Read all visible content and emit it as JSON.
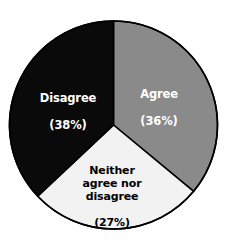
{
  "chart_data": {
    "type": "pie",
    "title": "",
    "subtitle": "",
    "xlabel": "",
    "ylabel": "",
    "legend_position": "none",
    "labels_inside_slices": true,
    "units": "percent",
    "total": 101,
    "categories": [
      "Agree",
      "Neither agree nor disagree",
      "Disagree"
    ],
    "values": [
      36,
      27,
      38
    ],
    "slices": [
      {
        "name": "Agree",
        "label": "Agree",
        "value": 36,
        "value_text": "(36%)",
        "color": "#8a8a8a",
        "text_color": "#ffffff",
        "start_angle_deg": 0,
        "end_angle_deg": 129.6
      },
      {
        "name": "Neither agree nor disagree",
        "label": "Neither\nagree nor\ndisagree",
        "value": 27,
        "value_text": "(27%)",
        "color": "#f2f2f2",
        "text_color": "#000000",
        "start_angle_deg": 129.6,
        "end_angle_deg": 226.8
      },
      {
        "name": "Disagree",
        "label": "Disagree",
        "value": 38,
        "value_text": "(38%)",
        "color": "#0a0a0a",
        "text_color": "#ffffff",
        "start_angle_deg": 226.8,
        "end_angle_deg": 360
      }
    ],
    "style": {
      "background": "#ffffff",
      "outline_color": "#000000",
      "outline_width": 1.6,
      "center_x": 113.5,
      "center_y": 125,
      "radius": 104,
      "start_at_twelve_oclock": true,
      "direction": "clockwise"
    }
  }
}
